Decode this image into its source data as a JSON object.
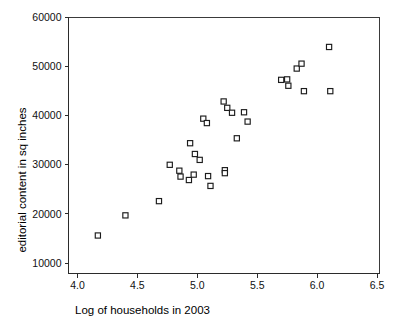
{
  "chart_data": {
    "type": "scatter",
    "title": "",
    "xlabel": "Log of households in 2003",
    "ylabel": "editorial content in sq inches",
    "xlim": [
      4.0,
      6.5
    ],
    "ylim": [
      10000,
      60000
    ],
    "xticks": [
      "4.0",
      "4.5",
      "5.0",
      "5.5",
      "6.0",
      "6.5"
    ],
    "xtick_values": [
      4.0,
      4.5,
      5.0,
      5.5,
      6.0,
      6.5
    ],
    "yticks": [
      "10000",
      "20000",
      "30000",
      "40000",
      "50000",
      "60000"
    ],
    "ytick_values": [
      10000,
      20000,
      30000,
      40000,
      50000,
      60000
    ],
    "grid": false,
    "legend": null,
    "marker": "open-square",
    "marker_color": "#1c1c1c",
    "series": [
      {
        "name": "publications",
        "points": [
          [
            4.17,
            15600
          ],
          [
            4.4,
            19700
          ],
          [
            4.68,
            22600
          ],
          [
            4.77,
            30000
          ],
          [
            4.85,
            28800
          ],
          [
            4.86,
            27600
          ],
          [
            4.93,
            26900
          ],
          [
            4.94,
            34400
          ],
          [
            4.97,
            28000
          ],
          [
            4.98,
            32200
          ],
          [
            5.02,
            31000
          ],
          [
            5.05,
            39400
          ],
          [
            5.08,
            38500
          ],
          [
            5.09,
            27700
          ],
          [
            5.11,
            25700
          ],
          [
            5.22,
            42900
          ],
          [
            5.23,
            28900
          ],
          [
            5.23,
            28300
          ],
          [
            5.25,
            41600
          ],
          [
            5.29,
            40600
          ],
          [
            5.33,
            35400
          ],
          [
            5.39,
            40700
          ],
          [
            5.42,
            38800
          ],
          [
            5.7,
            47300
          ],
          [
            5.75,
            47400
          ],
          [
            5.76,
            46100
          ],
          [
            5.83,
            49600
          ],
          [
            5.87,
            50600
          ],
          [
            5.89,
            45000
          ],
          [
            6.1,
            54000
          ],
          [
            6.11,
            45000
          ]
        ]
      }
    ]
  }
}
